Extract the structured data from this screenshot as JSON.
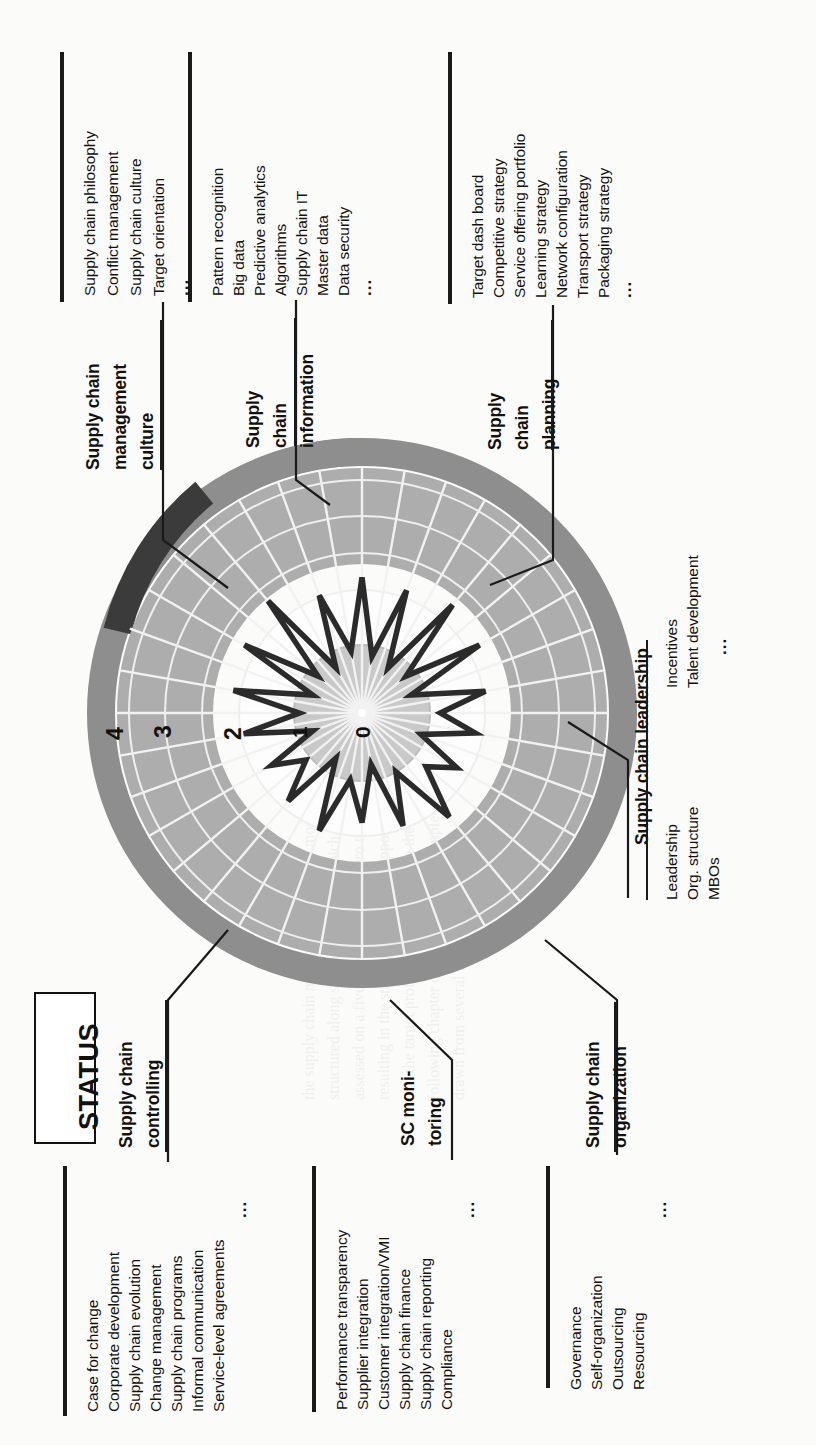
{
  "figure": {
    "status_label": "STATUS",
    "orientation": "rotated-90-ccw",
    "scale_ticks": [
      "0",
      "1",
      "2",
      "3",
      "4"
    ]
  },
  "groups": [
    {
      "id": "scm-culture",
      "heading": "Supply chain management culture",
      "items": [
        "Supply chain philosophy",
        "Conflict management",
        "Supply chain culture",
        "Target orientation"
      ],
      "ellipsis": "..."
    },
    {
      "id": "sc-information",
      "heading": "Supply chain information",
      "items": [
        "Pattern recognition",
        "Big data",
        "Predictive analytics",
        "Algorithms",
        "Supply chain IT",
        "Master data",
        "Data security"
      ],
      "ellipsis": "..."
    },
    {
      "id": "sc-planning",
      "heading": "Supply chain planning",
      "items": [
        "Target dash board",
        "Competitive strategy",
        "Service offering portfolio",
        "Learning strategy",
        "Network configuration",
        "Transport strategy",
        "Packaging strategy"
      ],
      "ellipsis": "..."
    },
    {
      "id": "sc-leadership",
      "heading": "Supply chain leadership",
      "items": [
        "Leadership",
        "Org. structure",
        "MBOs",
        "Incentives",
        "Talent development"
      ],
      "ellipsis": "..."
    },
    {
      "id": "sc-organization",
      "heading": "Supply chain organization",
      "items": [
        "Governance",
        "Self-organization",
        "Outsourcing",
        "Resourcing"
      ],
      "ellipsis": "..."
    },
    {
      "id": "sc-monitoring",
      "heading": "SC moni- toring",
      "items": [
        "Performance transparency",
        "Supplier integration",
        "Customer integration/VMI",
        "Supply chain finance",
        "Supply chain reporting",
        "Compliance"
      ],
      "ellipsis": "..."
    },
    {
      "id": "sc-controlling",
      "heading": "Supply chain controlling",
      "items": [
        "Case for change",
        "Corporate development",
        "Supply chain evolution",
        "Change management",
        "Supply chain programs",
        "Informal communication",
        "Service-level agreements"
      ],
      "ellipsis": "..."
    }
  ],
  "headings": {
    "culture_l1": "Supply chain",
    "culture_l2": "management",
    "culture_l3": "culture",
    "information_l1": "Supply",
    "information_l2": "chain",
    "information_l3": "information",
    "planning_l1": "Supply",
    "planning_l2": "chain",
    "planning_l3": "planning",
    "leadership": "Supply chain leadership",
    "organization_l1": "Supply chain",
    "organization_l2": "organization",
    "monitoring_l1": "SC moni-",
    "monitoring_l2": "toring",
    "controlling_l1": "Supply chain",
    "controlling_l2": "controlling"
  },
  "colors": {
    "ink": "#1a1a1a",
    "ring_mid": "#adadad",
    "ring_outer": "#8e8e8e",
    "ring_outer_dark": "#3b3b3b",
    "ring_inner": "#c9c9c9",
    "plot_line": "#2b2b2b",
    "page": "#fbfbfa"
  },
  "chart_data": {
    "type": "line",
    "subtype": "radar-polar",
    "title": "STATUS",
    "radial_axis": {
      "label": "Maturity level",
      "ticks": [
        0,
        1,
        2,
        3,
        4
      ],
      "range": [
        0,
        5
      ],
      "tick_label_position": "left-horizontal-spoke"
    },
    "bands": [
      {
        "name": "inner band (0-1)",
        "color": "#c9c9c9",
        "from": 0,
        "to": 1
      },
      {
        "name": "white band (1-2)",
        "color": "#ffffff",
        "from": 1,
        "to": 2
      },
      {
        "name": "mid grey band (2-4)",
        "color": "#adadad",
        "from": 2,
        "to": 4
      },
      {
        "name": "outer rim (4-5)",
        "color": "#8e8e8e",
        "from": 4,
        "to": 5
      },
      {
        "name": "outer rim highlight segment",
        "color": "#3b3b3b",
        "from": 4,
        "to": 5
      }
    ],
    "grid": true,
    "legend": false,
    "categories": [
      "Supply chain philosophy",
      "Conflict management",
      "Supply chain culture",
      "Target orientation",
      "Pattern recognition",
      "Big data",
      "Predictive analytics",
      "Algorithms",
      "Supply chain IT",
      "Master data",
      "Data security",
      "Target dash board",
      "Competitive strategy",
      "Service offering portfolio",
      "Learning strategy",
      "Network configuration",
      "Transport strategy",
      "Packaging strategy",
      "Leadership",
      "Org. structure",
      "MBOs",
      "Incentives",
      "Talent development",
      "Governance",
      "Self-organization",
      "Outsourcing",
      "Resourcing",
      "Performance transparency",
      "Supplier integration",
      "Customer integration/VMI",
      "Supply chain finance",
      "Supply chain reporting",
      "Compliance",
      "Case for change",
      "Corporate development",
      "Supply chain evolution"
    ],
    "series": [
      {
        "name": "Current status",
        "values": [
          2.6,
          1.1,
          2.5,
          1.0,
          2.7,
          1.1,
          2.6,
          1.0,
          2.4,
          1.5,
          2.2,
          1.2,
          2.1,
          1.6,
          2.6,
          1.3,
          2.3,
          1.0,
          2.1,
          1.3,
          2.4,
          1.0,
          2.2,
          1.4,
          2.0,
          1.0,
          2.3,
          1.2,
          2.5,
          1.0,
          2.6,
          1.1,
          2.8,
          1.0,
          2.4,
          1.2
        ]
      }
    ],
    "xlabel": "",
    "ylabel": "Maturity level (0-4)"
  }
}
